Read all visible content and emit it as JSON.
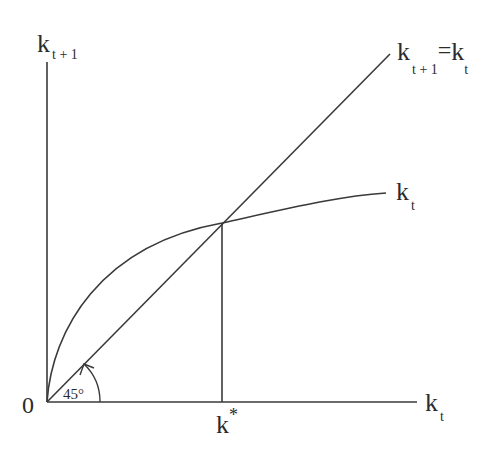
{
  "diagram": {
    "type": "solow-growth-phase-diagram",
    "line_color": "#3a3a3a",
    "y_axis_label": {
      "main": "k",
      "sub": "t + 1"
    },
    "x_axis_label": {
      "main": "k",
      "sub": "t"
    },
    "origin_label": "0",
    "diagonal_label": {
      "lhs_main": "k",
      "lhs_sub": "t + 1",
      "eq": "=",
      "rhs_main": "k",
      "rhs_sub": "t"
    },
    "curve_label": {
      "main": "k",
      "sub": "t"
    },
    "steady_state_label": {
      "main": "k",
      "sup": "*"
    },
    "angle_label": "45°"
  }
}
